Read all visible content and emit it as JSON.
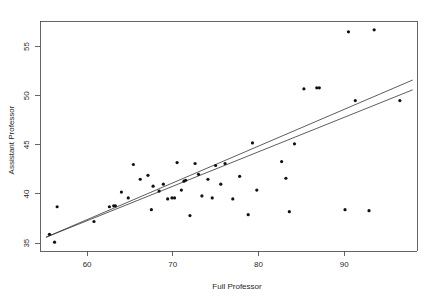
{
  "chart_data": {
    "type": "scatter",
    "title": "",
    "xlabel": "Full Professor",
    "ylabel": "Assistant Professor",
    "xlim": [
      54.5,
      98.5
    ],
    "ylim": [
      34.2,
      57.6
    ],
    "xticks": [
      60,
      70,
      80,
      90
    ],
    "xtick_labels": [
      "60",
      "70",
      "80",
      "90"
    ],
    "yticks": [
      35,
      40,
      45,
      50,
      55
    ],
    "ytick_labels": [
      "35",
      "40",
      "45",
      "50",
      "55"
    ],
    "grid": false,
    "legend": "none",
    "points": [
      {
        "x": 55.6,
        "y": 35.9
      },
      {
        "x": 56.2,
        "y": 35.1
      },
      {
        "x": 56.5,
        "y": 38.7
      },
      {
        "x": 60.8,
        "y": 37.2
      },
      {
        "x": 62.6,
        "y": 38.7
      },
      {
        "x": 63.1,
        "y": 38.8
      },
      {
        "x": 63.3,
        "y": 38.8
      },
      {
        "x": 64.0,
        "y": 40.2
      },
      {
        "x": 64.8,
        "y": 39.6
      },
      {
        "x": 65.4,
        "y": 43.0
      },
      {
        "x": 66.2,
        "y": 41.5
      },
      {
        "x": 67.1,
        "y": 41.9
      },
      {
        "x": 67.5,
        "y": 38.4
      },
      {
        "x": 67.7,
        "y": 40.8
      },
      {
        "x": 68.4,
        "y": 40.3
      },
      {
        "x": 68.9,
        "y": 41.0
      },
      {
        "x": 69.4,
        "y": 39.5
      },
      {
        "x": 69.9,
        "y": 39.6
      },
      {
        "x": 70.2,
        "y": 39.6
      },
      {
        "x": 70.5,
        "y": 43.2
      },
      {
        "x": 71.0,
        "y": 40.4
      },
      {
        "x": 71.3,
        "y": 41.3
      },
      {
        "x": 71.5,
        "y": 41.4
      },
      {
        "x": 72.0,
        "y": 37.8
      },
      {
        "x": 72.6,
        "y": 43.1
      },
      {
        "x": 73.0,
        "y": 42.0
      },
      {
        "x": 73.4,
        "y": 39.8
      },
      {
        "x": 74.1,
        "y": 41.5
      },
      {
        "x": 74.6,
        "y": 39.6
      },
      {
        "x": 75.0,
        "y": 42.9
      },
      {
        "x": 75.6,
        "y": 41.0
      },
      {
        "x": 76.1,
        "y": 43.1
      },
      {
        "x": 77.0,
        "y": 39.5
      },
      {
        "x": 77.8,
        "y": 41.8
      },
      {
        "x": 78.8,
        "y": 37.9
      },
      {
        "x": 79.3,
        "y": 45.2
      },
      {
        "x": 79.8,
        "y": 40.4
      },
      {
        "x": 82.7,
        "y": 43.3
      },
      {
        "x": 83.2,
        "y": 41.6
      },
      {
        "x": 83.6,
        "y": 38.2
      },
      {
        "x": 84.2,
        "y": 45.1
      },
      {
        "x": 85.3,
        "y": 50.7
      },
      {
        "x": 86.8,
        "y": 50.8
      },
      {
        "x": 87.1,
        "y": 50.8
      },
      {
        "x": 90.1,
        "y": 38.4
      },
      {
        "x": 90.5,
        "y": 56.5
      },
      {
        "x": 91.3,
        "y": 49.5
      },
      {
        "x": 92.9,
        "y": 38.3
      },
      {
        "x": 93.5,
        "y": 56.7
      },
      {
        "x": 96.5,
        "y": 49.5
      }
    ],
    "fit_lines": [
      {
        "name": "regression-line-1",
        "x1": 55.2,
        "y1": 35.6,
        "x2": 98.0,
        "y2": 51.6
      },
      {
        "name": "regression-line-2",
        "x1": 55.2,
        "y1": 35.6,
        "x2": 98.0,
        "y2": 50.6
      }
    ]
  }
}
